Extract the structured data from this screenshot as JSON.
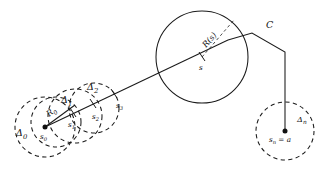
{
  "figure": {
    "background_color": "#ffffff",
    "ink_color": "#1a1a1a",
    "width": 336,
    "height": 172
  },
  "labels": {
    "delta_0": "Δ0",
    "delta_1": "Δ1",
    "delta_2": "Δ2",
    "delta_n": "Δn",
    "radius_0": "R0",
    "radius_s": "R(s)",
    "point_s0": "s0",
    "point_s1": "s1",
    "point_s2": "s2",
    "point_s3": "s3",
    "point_s": "s",
    "point_sn": "sn = a",
    "curve_c": "C"
  },
  "label_parts": {
    "delta_0_base": "Δ",
    "delta_0_sub": "0",
    "delta_1_base": "Δ",
    "delta_1_sub": "1",
    "delta_2_base": "Δ",
    "delta_2_sub": "2",
    "delta_n_base": "Δ",
    "delta_n_sub": "n",
    "radius_0_base": "R",
    "radius_0_sub": "0",
    "radius_s_text": "R(s)",
    "s0_base": "s",
    "s0_sub": "0",
    "s1_base": "s",
    "s1_sub": "1",
    "s2_base": "s",
    "s2_sub": "2",
    "s3_base": "s",
    "s3_sub": "3",
    "s_text": "s",
    "sn_base": "s",
    "sn_sub": "n",
    "sn_eq": " = a",
    "c_text": "C"
  },
  "geometry": {
    "disks": [
      {
        "name": "delta-0",
        "cx": 45,
        "cy": 127,
        "r": 30,
        "style": "dashed"
      },
      {
        "name": "delta-0-inner",
        "cx": 55,
        "cy": 123,
        "r": 25,
        "style": "dashed"
      },
      {
        "name": "delta-1",
        "cx": 74,
        "cy": 117,
        "r": 27,
        "style": "dashed"
      },
      {
        "name": "delta-2",
        "cx": 93,
        "cy": 109,
        "r": 25,
        "style": "dashed"
      },
      {
        "name": "delta-n",
        "cx": 285,
        "cy": 131,
        "r": 29,
        "style": "dashed"
      },
      {
        "name": "disk-s",
        "cx": 202,
        "cy": 57,
        "r": 46,
        "style": "solid"
      }
    ],
    "dots": [
      {
        "name": "s0-dot",
        "cx": 45,
        "cy": 127,
        "r": 2.4
      },
      {
        "name": "sn-dot",
        "cx": 285,
        "cy": 131,
        "r": 2.4
      }
    ],
    "main_line": {
      "from_x": 45,
      "from_y": 127,
      "to_x": 228,
      "to_y": 40
    },
    "radius_line_0": {
      "from_x": 45,
      "from_y": 127,
      "to_x": 74,
      "to_y": 104
    },
    "radius_line_s": {
      "from_x": 202,
      "from_y": 57,
      "to_x": 233,
      "to_y": 20
    },
    "curve_path": "M 228 40 L 252 33 L 285 52 L 285 131",
    "ticks": [
      {
        "name": "tick-s1",
        "x": 73,
        "y": 113
      },
      {
        "name": "tick-s2",
        "x": 93,
        "y": 104
      },
      {
        "name": "tick-s3",
        "x": 114,
        "y": 94
      },
      {
        "name": "tick-s",
        "x": 202,
        "y": 57
      }
    ]
  }
}
